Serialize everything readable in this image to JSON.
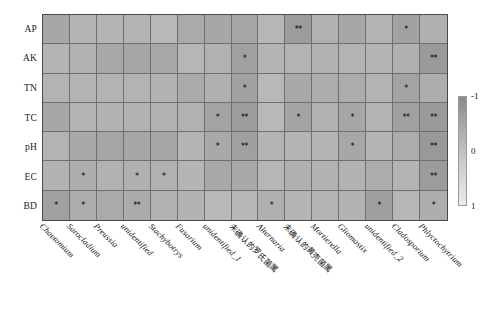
{
  "chart_data": {
    "type": "heatmap",
    "title": "",
    "xlabel": "",
    "ylabel": "",
    "row_labels": [
      "AP",
      "AK",
      "TN",
      "TC",
      "pH",
      "EC",
      "BD"
    ],
    "col_labels": [
      "Chaetomium",
      "Sarocladium",
      "Preussia",
      "unidentified",
      "Stachybotrys",
      "Fusarium",
      "unidentified_1",
      "未确认的罗氏菌属",
      "Alternaria",
      "未确认的黄壳菌属",
      "Mortierella",
      "Gliomastix",
      "unidentified_2",
      "Cladosporium",
      "Phlyctochytrium"
    ],
    "col_label_is_cjk": [
      false,
      false,
      false,
      false,
      false,
      false,
      false,
      true,
      false,
      true,
      false,
      false,
      false,
      false,
      false
    ],
    "colorbar": {
      "ticks": [
        "-1",
        "0",
        "1"
      ],
      "tick_values": [
        -1,
        0,
        1
      ],
      "vmin": -1,
      "vmax": 1,
      "orientation": "vertical",
      "position": "right",
      "high_color": "#8a8a8a",
      "low_color": "#ebebeb"
    },
    "legend_note": "* p<0.05, ** p<0.01",
    "grid": true,
    "values": [
      [
        -0.4,
        -0.12,
        -0.14,
        -0.16,
        -0.06,
        -0.34,
        -0.4,
        -0.44,
        -0.08,
        -0.62,
        -0.2,
        -0.4,
        -0.16,
        -0.5,
        -0.22
      ],
      [
        -0.14,
        -0.18,
        -0.38,
        -0.42,
        -0.38,
        -0.1,
        -0.2,
        -0.52,
        -0.14,
        -0.16,
        -0.18,
        -0.16,
        -0.14,
        -0.22,
        -0.66
      ],
      [
        -0.16,
        -0.14,
        -0.16,
        -0.16,
        -0.18,
        -0.34,
        -0.22,
        -0.5,
        -0.06,
        -0.36,
        -0.3,
        -0.3,
        -0.16,
        -0.48,
        -0.26
      ],
      [
        -0.4,
        -0.16,
        -0.18,
        -0.18,
        -0.2,
        -0.2,
        -0.48,
        -0.6,
        -0.06,
        -0.46,
        -0.18,
        -0.42,
        -0.16,
        -0.52,
        -0.66
      ],
      [
        -0.16,
        -0.36,
        -0.44,
        -0.4,
        -0.44,
        -0.14,
        -0.36,
        -0.54,
        -0.14,
        -0.14,
        -0.12,
        -0.4,
        -0.12,
        -0.3,
        -0.7
      ],
      [
        -0.18,
        -0.26,
        -0.18,
        -0.22,
        -0.2,
        -0.12,
        -0.38,
        -0.36,
        -0.1,
        -0.22,
        -0.18,
        -0.18,
        -0.3,
        -0.14,
        -0.62
      ],
      [
        -0.52,
        -0.3,
        -0.34,
        -0.32,
        -0.2,
        -0.18,
        -0.06,
        -0.1,
        -0.24,
        -0.12,
        -0.14,
        -0.18,
        -0.56,
        -0.1,
        -0.26
      ]
    ],
    "significance": [
      [
        "",
        "",
        "",
        "",
        "",
        "",
        "",
        "",
        "",
        "**",
        "",
        "",
        "",
        "*",
        ""
      ],
      [
        "",
        "",
        "",
        "",
        "",
        "",
        "",
        "*",
        "",
        "",
        "",
        "",
        "",
        "",
        "**"
      ],
      [
        "",
        "",
        "",
        "",
        "",
        "",
        "",
        "*",
        "",
        "",
        "",
        "",
        "",
        "*",
        ""
      ],
      [
        "",
        "",
        "",
        "",
        "",
        "",
        "*",
        "**",
        "",
        "*",
        "",
        "*",
        "",
        "**",
        "**"
      ],
      [
        "",
        "",
        "",
        "",
        "",
        "",
        "*",
        "**",
        "",
        "",
        "",
        "*",
        "",
        "",
        "**"
      ],
      [
        "",
        "*",
        "",
        "*",
        "*",
        "",
        "",
        "",
        "",
        "",
        "",
        "",
        "",
        "",
        "**"
      ],
      [
        "*",
        "*",
        "",
        "**",
        "",
        "",
        "",
        "",
        "*",
        "",
        "",
        "",
        "*",
        "",
        "*"
      ]
    ]
  }
}
